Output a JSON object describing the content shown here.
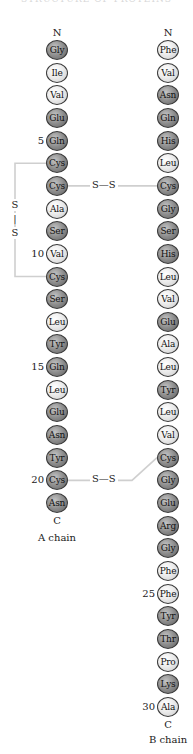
{
  "heading": "STRUCTURE OF PROTEINS",
  "layout": {
    "first_residue_y": 50,
    "residue_spacing": 22.65,
    "a_chain_x": 57,
    "b_chain_x": 168
  },
  "colors": {
    "light_residue": "#e6e6e6",
    "dark_residue": "#8d8d8d",
    "bond_line": "#cfcfcf",
    "text": "#1a1a1a"
  },
  "a_chain": {
    "n_terminus": "N",
    "c_terminus": "C",
    "label": "A chain",
    "residues": [
      {
        "name": "Gly",
        "shade": "dark"
      },
      {
        "name": "Ile",
        "shade": "light"
      },
      {
        "name": "Val",
        "shade": "light"
      },
      {
        "name": "Glu",
        "shade": "dark"
      },
      {
        "name": "Gln",
        "shade": "dark",
        "number": "5"
      },
      {
        "name": "Cys",
        "shade": "dark"
      },
      {
        "name": "Cys",
        "shade": "dark"
      },
      {
        "name": "Ala",
        "shade": "light"
      },
      {
        "name": "Ser",
        "shade": "dark"
      },
      {
        "name": "Val",
        "shade": "light",
        "number": "10"
      },
      {
        "name": "Cys",
        "shade": "dark"
      },
      {
        "name": "Ser",
        "shade": "dark"
      },
      {
        "name": "Leu",
        "shade": "light"
      },
      {
        "name": "Tyr",
        "shade": "dark"
      },
      {
        "name": "Gln",
        "shade": "dark",
        "number": "15"
      },
      {
        "name": "Leu",
        "shade": "light"
      },
      {
        "name": "Glu",
        "shade": "dark"
      },
      {
        "name": "Asn",
        "shade": "dark"
      },
      {
        "name": "Tyr",
        "shade": "dark"
      },
      {
        "name": "Cys",
        "shade": "dark",
        "number": "20"
      },
      {
        "name": "Asn",
        "shade": "dark"
      }
    ]
  },
  "b_chain": {
    "n_terminus": "N",
    "c_terminus": "C",
    "label": "B chain",
    "residues": [
      {
        "name": "Phe",
        "shade": "light"
      },
      {
        "name": "Val",
        "shade": "light"
      },
      {
        "name": "Asn",
        "shade": "dark"
      },
      {
        "name": "Gln",
        "shade": "dark"
      },
      {
        "name": "His",
        "shade": "dark"
      },
      {
        "name": "Leu",
        "shade": "light"
      },
      {
        "name": "Cys",
        "shade": "dark"
      },
      {
        "name": "Gly",
        "shade": "dark"
      },
      {
        "name": "Ser",
        "shade": "dark"
      },
      {
        "name": "His",
        "shade": "dark"
      },
      {
        "name": "Leu",
        "shade": "light"
      },
      {
        "name": "Val",
        "shade": "light"
      },
      {
        "name": "Glu",
        "shade": "dark"
      },
      {
        "name": "Ala",
        "shade": "light"
      },
      {
        "name": "Leu",
        "shade": "light"
      },
      {
        "name": "Tyr",
        "shade": "dark"
      },
      {
        "name": "Leu",
        "shade": "light"
      },
      {
        "name": "Val",
        "shade": "light"
      },
      {
        "name": "Cys",
        "shade": "dark"
      },
      {
        "name": "Gly",
        "shade": "dark"
      },
      {
        "name": "Glu",
        "shade": "dark"
      },
      {
        "name": "Arg",
        "shade": "dark"
      },
      {
        "name": "Gly",
        "shade": "dark"
      },
      {
        "name": "Phe",
        "shade": "light"
      },
      {
        "name": "Phe",
        "shade": "light",
        "number": "25"
      },
      {
        "name": "Tyr",
        "shade": "dark"
      },
      {
        "name": "Thr",
        "shade": "dark"
      },
      {
        "name": "Pro",
        "shade": "light"
      },
      {
        "name": "Lys",
        "shade": "dark"
      },
      {
        "name": "Ala",
        "shade": "light",
        "number": "30"
      }
    ]
  },
  "disulfide_bonds": [
    {
      "type": "intrachain",
      "from_chain": "A",
      "from_index": 6,
      "to_chain": "A",
      "to_index": 11,
      "label_top": "S",
      "label_mid": "|",
      "label_bottom": "S"
    },
    {
      "type": "interchain",
      "from_chain": "A",
      "from_index": 7,
      "to_chain": "B",
      "to_index": 7,
      "label": "S—S"
    },
    {
      "type": "interchain",
      "from_chain": "A",
      "from_index": 20,
      "to_chain": "B",
      "to_index": 19,
      "label": "S—S"
    }
  ]
}
